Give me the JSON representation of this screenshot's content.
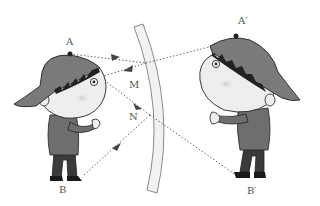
{
  "figure": {
    "labels": {
      "A": "A",
      "A_prime": "A′",
      "B": "B",
      "B_prime": "B′",
      "M": "M",
      "N": "N"
    },
    "colors": {
      "background": "#ffffff",
      "mirror_fill": "#f2f2f2",
      "mirror_stroke": "#8a8a8a",
      "ray": "#666666",
      "cap": "#7a7a7a",
      "shirt": "#6e6e6e",
      "pants": "#3a3a3a",
      "skin": "#eeeeee",
      "outline": "#222222",
      "label": "#555555"
    },
    "elements": [
      "boy (object)",
      "curved mirror",
      "boy image (virtual)",
      "incident and reflected rays",
      "dotted extension lines"
    ]
  }
}
